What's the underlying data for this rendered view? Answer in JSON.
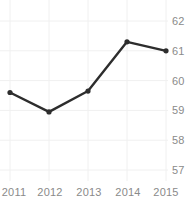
{
  "chart_data": {
    "type": "line",
    "title": "",
    "subtitle": "",
    "xlabel": "",
    "ylabel": "",
    "categories": [
      "2011",
      "2012",
      "2013",
      "2014",
      "2015"
    ],
    "values": [
      59.6,
      58.95,
      59.65,
      61.3,
      61.0
    ],
    "series": [
      {
        "name": "",
        "values": [
          59.6,
          58.95,
          59.65,
          61.3,
          61.0
        ]
      }
    ],
    "x_tick_labels": [
      "2011",
      "2012",
      "2013",
      "2014",
      "2015"
    ],
    "y_tick_labels": [
      "62",
      "61",
      "60",
      "59",
      "58",
      "57"
    ],
    "y_ticks": [
      62,
      61,
      60,
      59,
      58,
      57
    ],
    "ylim": [
      57,
      62
    ],
    "grid": true,
    "grid_x": true,
    "grid_y": true,
    "legend": false,
    "legend_position": "none",
    "annotations": [],
    "markers": "circle",
    "colors": {
      "line": "#2d2d2d",
      "marker": "#2d2d2d",
      "grid": "#f0f0f0",
      "tick_label": "#8a8a8a",
      "background": "#ffffff"
    }
  },
  "y_axis": {
    "tick_0": "62",
    "tick_1": "61",
    "tick_2": "60",
    "tick_3": "59",
    "tick_4": "58",
    "tick_5": "57"
  },
  "x_axis": {
    "tick_0": "2011",
    "tick_1": "2012",
    "tick_2": "2013",
    "tick_3": "2014",
    "tick_4": "2015"
  }
}
